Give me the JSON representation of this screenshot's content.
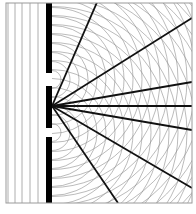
{
  "diagram": {
    "type": "double-slit-interference",
    "frame": {
      "x": 6,
      "y": 3,
      "width": 186,
      "height": 200,
      "stroke": "#9a9a9a"
    },
    "barrier": {
      "x": 46,
      "width": 6,
      "color": "#000000",
      "segments": [
        {
          "y1": 3,
          "y2": 73
        },
        {
          "y1": 86,
          "y2": 128
        },
        {
          "y1": 137,
          "y2": 203
        }
      ]
    },
    "slits": [
      {
        "cx": 52,
        "cy": 79.5
      },
      {
        "cx": 52,
        "cy": 132.5
      }
    ],
    "plane_waves": {
      "x_positions": [
        8,
        15,
        22,
        30,
        38
      ],
      "stroke": "#9a9a9a"
    },
    "circular_waves": {
      "spacing": 9,
      "count": 22,
      "stroke": "#8c8c8c"
    },
    "maxima_lines": {
      "origin": {
        "x": 52,
        "y": 106
      },
      "stroke": "#111111",
      "endpoints": [
        {
          "x": 98,
          "y": 0
        },
        {
          "x": 192,
          "y": 18
        },
        {
          "x": 192,
          "y": 82
        },
        {
          "x": 192,
          "y": 106
        },
        {
          "x": 192,
          "y": 130
        },
        {
          "x": 192,
          "y": 188
        },
        {
          "x": 118,
          "y": 203
        }
      ]
    },
    "colors": {
      "background": "#ffffff",
      "barrier": "#000000",
      "wave": "#8c8c8c",
      "maxima": "#111111"
    }
  }
}
